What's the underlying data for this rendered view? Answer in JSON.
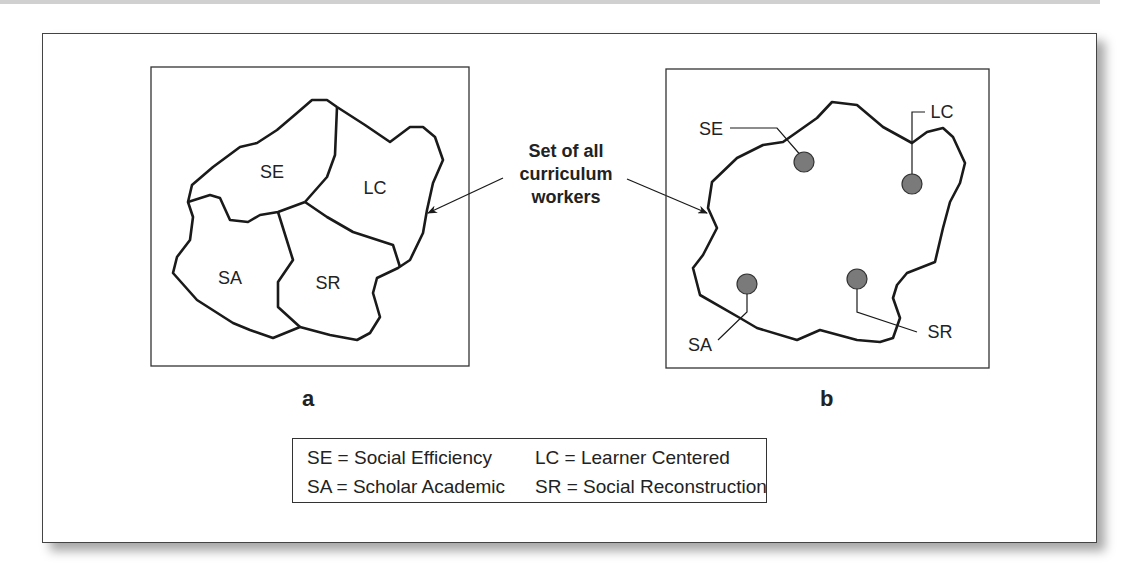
{
  "figure": {
    "annotation": [
      "Set of all",
      "curriculum",
      "workers"
    ],
    "panel_a": {
      "label": "a",
      "regions": [
        {
          "abbr": "SE"
        },
        {
          "abbr": "LC"
        },
        {
          "abbr": "SA"
        },
        {
          "abbr": "SR"
        }
      ]
    },
    "panel_b": {
      "label": "b",
      "points": [
        {
          "abbr": "SE"
        },
        {
          "abbr": "LC"
        },
        {
          "abbr": "SA"
        },
        {
          "abbr": "SR"
        }
      ]
    },
    "legend": [
      {
        "text": "SE = Social Efficiency"
      },
      {
        "text": "LC = Learner Centered"
      },
      {
        "text": "SA = Scholar Academic"
      },
      {
        "text": "SR = Social Reconstruction"
      }
    ],
    "colors": {
      "stroke": "#1a1a1a",
      "point_fill": "#7a7a7a"
    }
  }
}
